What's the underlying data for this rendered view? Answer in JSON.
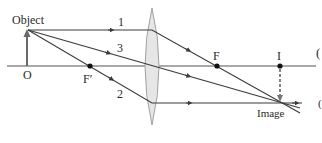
{
  "diagram": {
    "labels": {
      "object": "Object",
      "object_point": "O",
      "focal_left": "F′",
      "focal_right": "F",
      "image_point": "I",
      "image": "Image",
      "ray1": "1",
      "ray2": "2",
      "ray3": "3",
      "edge_mark_top": "(",
      "edge_mark_bottom": "("
    },
    "colors": {
      "line": "#3a3a3a",
      "lens_fill": "#e6e6e6",
      "lens_stroke": "#9a9a9a",
      "arrow_object": "#6a6a6a",
      "dashed_arrow": "#777777"
    }
  }
}
